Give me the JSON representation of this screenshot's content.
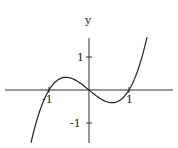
{
  "chart_data": {
    "type": "line",
    "title": "",
    "function": "y = x^3 - x",
    "xlabel": "",
    "ylabel": "y",
    "xlim": [
      -1.45,
      1.45
    ],
    "ylim": [
      -1.6,
      1.6
    ],
    "x_ticks": [
      -1,
      1
    ],
    "x_tick_labels": [
      "-1",
      "1"
    ],
    "y_ticks": [
      -1,
      1
    ],
    "y_tick_labels": [
      "-1",
      "1"
    ],
    "grid": false,
    "legend": null,
    "series": [
      {
        "name": "x^3 - x",
        "x": [
          -1.45,
          -1.2,
          -1.0,
          -0.8,
          -0.577,
          -0.4,
          -0.2,
          0,
          0.2,
          0.4,
          0.577,
          0.8,
          1.0,
          1.2,
          1.45
        ],
        "y": [
          -1.6,
          -0.53,
          0,
          0.29,
          0.385,
          0.34,
          0.19,
          0,
          -0.19,
          -0.34,
          -0.385,
          -0.29,
          0,
          0.53,
          1.6
        ]
      }
    ]
  },
  "labels": {
    "y_axis": "y",
    "x_neg1": "-1",
    "x_pos1": "1",
    "y_pos1": "1",
    "y_neg1": "-1"
  },
  "style": {
    "line_color": "#222222",
    "axis_color": "#333333",
    "background": "#ffffff"
  }
}
